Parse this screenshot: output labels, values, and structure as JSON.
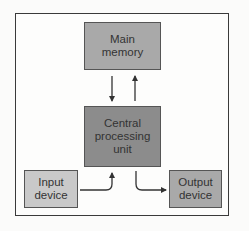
{
  "diagram": {
    "nodes": [
      {
        "id": "main_memory",
        "lines": [
          "Main",
          "memory"
        ],
        "fill": "#a9a9a9"
      },
      {
        "id": "cpu",
        "lines": [
          "Central",
          "processing",
          "unit"
        ],
        "fill": "#8c8c8c"
      },
      {
        "id": "input_device",
        "lines": [
          "Input",
          "device"
        ],
        "fill": "#c9c9c9"
      },
      {
        "id": "output_device",
        "lines": [
          "Output",
          "device"
        ],
        "fill": "#a9a9a9"
      }
    ],
    "edges": [
      {
        "from": "main_memory",
        "to": "cpu"
      },
      {
        "from": "cpu",
        "to": "main_memory"
      },
      {
        "from": "input_device",
        "to": "cpu"
      },
      {
        "from": "cpu",
        "to": "output_device"
      }
    ]
  }
}
